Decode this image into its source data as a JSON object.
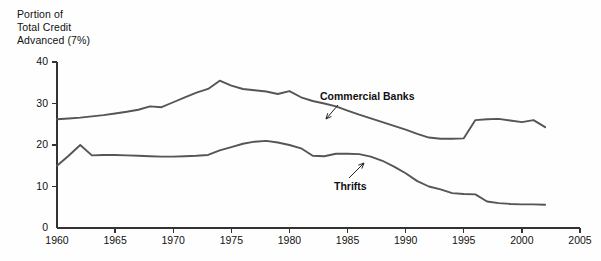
{
  "chart_data": {
    "type": "line",
    "title_lines": [
      "Portion of",
      "Total Credit",
      "Advanced (7%)"
    ],
    "xlabel": "",
    "ylabel": "Portion of Total Credit Advanced (7%)",
    "xlim": [
      1960,
      2005
    ],
    "ylim": [
      0,
      40
    ],
    "grid": false,
    "legend_position": "inline-annotations",
    "xticks": [
      1960,
      1965,
      1970,
      1975,
      1980,
      1985,
      1990,
      1995,
      2000,
      2005
    ],
    "xtick_labels": [
      "1960",
      "1965",
      "1970",
      "1975",
      "1980",
      "1985",
      "1990",
      "1995",
      "2000",
      "2005"
    ],
    "yticks": [
      0,
      10,
      20,
      30,
      40
    ],
    "ytick_labels": [
      "0",
      "10",
      "20",
      "30",
      "40"
    ],
    "x": [
      1960,
      1961,
      1962,
      1963,
      1964,
      1965,
      1966,
      1967,
      1968,
      1969,
      1970,
      1971,
      1972,
      1973,
      1974,
      1975,
      1976,
      1977,
      1978,
      1979,
      1980,
      1981,
      1982,
      1983,
      1984,
      1985,
      1986,
      1987,
      1988,
      1989,
      1990,
      1991,
      1992,
      1993,
      1994,
      1995,
      1996,
      1997,
      1998,
      1999,
      2000,
      2001,
      2002
    ],
    "series": [
      {
        "name": "Commercial Banks",
        "color": "#555555",
        "annotation": "Commercial Banks",
        "values": [
          26.2,
          26.4,
          26.6,
          26.9,
          27.2,
          27.6,
          28.0,
          28.5,
          29.3,
          29.1,
          30.3,
          31.5,
          32.6,
          33.5,
          35.5,
          34.3,
          33.5,
          33.2,
          32.9,
          32.3,
          33.0,
          31.5,
          30.6,
          30.0,
          29.3,
          28.3,
          27.3,
          26.4,
          25.5,
          24.6,
          23.7,
          22.7,
          21.8,
          21.5,
          21.5,
          21.6,
          26.0,
          26.2,
          26.3,
          25.9,
          25.5,
          26.0,
          24.3
        ]
      },
      {
        "name": "Thrifts",
        "color": "#555555",
        "annotation": "Thrifts",
        "values": [
          15.0,
          17.4,
          20.0,
          17.5,
          17.6,
          17.6,
          17.5,
          17.4,
          17.3,
          17.2,
          17.2,
          17.3,
          17.4,
          17.6,
          18.7,
          19.5,
          20.3,
          20.8,
          21.0,
          20.6,
          20.0,
          19.2,
          17.4,
          17.3,
          17.9,
          17.9,
          17.8,
          17.2,
          16.2,
          14.8,
          13.2,
          11.3,
          10.0,
          9.3,
          8.4,
          8.2,
          8.1,
          6.4,
          6.0,
          5.8,
          5.7,
          5.7,
          5.6
        ]
      }
    ]
  },
  "axes": {
    "axis_color": "#333333",
    "tick_length": 5
  }
}
